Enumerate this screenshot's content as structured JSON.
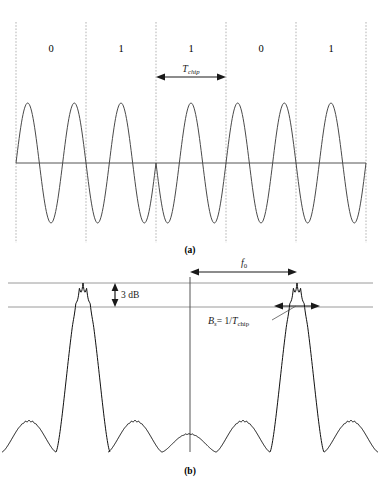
{
  "figure": {
    "panel_a": {
      "caption": "(a)",
      "bit_labels": [
        "0",
        "1",
        "1",
        "0",
        "1"
      ],
      "chip_annotation": {
        "symbol": "T",
        "subscript": "chip",
        "full_text": "T_chip"
      }
    },
    "panel_b": {
      "caption": "(b)",
      "annotations": {
        "carrier": {
          "symbol": "f",
          "subscript": "0",
          "full_text": "f_0"
        },
        "bandwidth_drop": "3 dB",
        "null_bandwidth": {
          "symbol": "B",
          "subscript": "s",
          "equals": "= 1/",
          "denominator_symbol": "T",
          "denominator_subscript": "chip",
          "full_text": "B_s = 1/T_chip"
        }
      }
    }
  },
  "colors": {
    "ink": "#1a1a1a",
    "curve": "#3d3d3d",
    "gridline": "#9a9a9a",
    "dashed": "#b0b0b0",
    "axis": "#555555",
    "background": "#ffffff"
  },
  "chart_data": {
    "type": "line",
    "title": "",
    "panels": [
      {
        "id": "a",
        "type": "line",
        "xlabel": "",
        "ylabel": "",
        "description": "BPSK direct-sequence spread spectrum chip waveform",
        "chip_boundaries_x": [
          16,
          86,
          156,
          226,
          296,
          366
        ],
        "chip_count": 5,
        "bits": [
          "0",
          "1",
          "1",
          "0",
          "1"
        ],
        "cycles_per_chip": 1.5,
        "baseline_y": 163,
        "amplitude": 60,
        "xlim": [
          16,
          366
        ],
        "ylim": [
          -1,
          1
        ],
        "grid": false
      },
      {
        "id": "b",
        "type": "line",
        "xlabel": "",
        "ylabel": "",
        "description": "Power spectral density, sinc-squared lobes about +/- f0",
        "carrier_centers_x": [
          83,
          297
        ],
        "center_axis_x": 190,
        "baseline_y": 452,
        "peak_y": 283,
        "minus_3db_y": 307,
        "lobe_half_width": 27,
        "xlim": [
          8,
          373
        ],
        "ylim": [
          0,
          1
        ],
        "grid": false,
        "reference_lines": [
          {
            "label": "peak",
            "y": 283
          },
          {
            "label": "-3 dB",
            "y": 307
          }
        ],
        "series": [
          {
            "name": "sinc-squared envelope",
            "lobe_peak_levels": [
              0.22,
              0.42,
              1.0,
              0.42,
              0.26,
              0.19,
              0.15,
              0.15,
              0.19,
              0.26,
              0.42,
              1.0,
              0.42,
              0.22
            ]
          }
        ]
      }
    ]
  }
}
